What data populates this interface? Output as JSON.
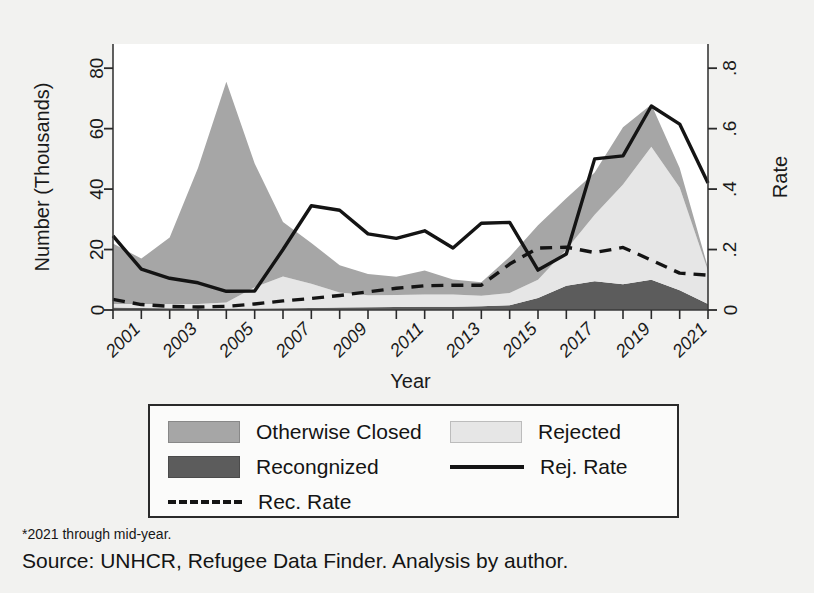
{
  "chart_data": {
    "type": "area",
    "title": "",
    "subtitle": "",
    "xlabel": "Year",
    "ylabel": "Number (Thousands)",
    "y2label": "Rate",
    "xlim": [
      2000,
      2021
    ],
    "ylim": [
      0,
      88
    ],
    "y2lim": [
      0,
      0.88
    ],
    "grid": false,
    "legend_position": "below-plot",
    "stacked": true,
    "x": [
      2000,
      2001,
      2002,
      2003,
      2004,
      2005,
      2006,
      2007,
      2008,
      2009,
      2010,
      2011,
      2012,
      2013,
      2014,
      2015,
      2016,
      2017,
      2018,
      2019,
      2020,
      2021
    ],
    "x_tick_labels": [
      "2001",
      "2003",
      "2005",
      "2007",
      "2009",
      "2011",
      "2013",
      "2015",
      "2017",
      "2019",
      "2021"
    ],
    "y_tick_labels": [
      "0",
      "20",
      "40",
      "60",
      "80"
    ],
    "y2_tick_labels": [
      "0",
      ".2",
      ".4",
      ".6",
      ".8"
    ],
    "series": [
      {
        "name": "Recongnized",
        "kind": "area",
        "stack_order": 1,
        "axis": "left",
        "color": "#5c5c5c",
        "values": [
          0.8,
          0.7,
          0.6,
          0.5,
          0.5,
          0.5,
          0.6,
          0.7,
          0.8,
          0.9,
          1.0,
          1.1,
          1.1,
          1.2,
          1.6,
          4.0,
          8.0,
          9.5,
          8.5,
          10.0,
          6.5,
          2.0
        ]
      },
      {
        "name": "Rejected",
        "kind": "area",
        "stack_order": 2,
        "axis": "left",
        "color": "#e6e6e6",
        "values": [
          1.2,
          1.3,
          1.4,
          1.5,
          2.0,
          7.0,
          10.5,
          8.0,
          5.0,
          4.0,
          4.0,
          4.0,
          4.0,
          3.5,
          4.0,
          6.0,
          12.0,
          22.0,
          33.0,
          44.0,
          34.0,
          11.0
        ]
      },
      {
        "name": "Otherwise Closed",
        "kind": "area",
        "stack_order": 3,
        "axis": "left",
        "color": "#a6a6a6",
        "values": [
          20.0,
          15.0,
          22.0,
          45.0,
          73.0,
          41.0,
          18.0,
          13.5,
          9.0,
          7.0,
          6.0,
          8.0,
          5.0,
          4.5,
          12.0,
          18.0,
          17.0,
          14.0,
          19.0,
          14.0,
          6.5,
          1.0
        ]
      },
      {
        "name": "Rej. Rate",
        "kind": "line",
        "style": "solid",
        "axis": "right",
        "color": "#141414",
        "values": [
          0.245,
          0.135,
          0.105,
          0.09,
          0.062,
          0.063,
          0.2,
          0.345,
          0.33,
          0.252,
          0.237,
          0.262,
          0.205,
          0.287,
          0.29,
          0.132,
          0.185,
          0.5,
          0.51,
          0.675,
          0.615,
          0.42
        ]
      },
      {
        "name": "Rec. Rate",
        "kind": "line",
        "style": "dashed",
        "axis": "right",
        "color": "#141414",
        "values": [
          0.035,
          0.018,
          0.012,
          0.01,
          0.012,
          0.02,
          0.03,
          0.038,
          0.048,
          0.06,
          0.072,
          0.08,
          0.082,
          0.082,
          0.152,
          0.205,
          0.208,
          0.19,
          0.207,
          0.165,
          0.122,
          0.115
        ]
      }
    ]
  },
  "axes": {
    "y_left_title": "Number (Thousands)",
    "y_right_title": "Rate",
    "x_title": "Year"
  },
  "legend": {
    "entries": [
      {
        "label": "Otherwise Closed",
        "marker": "swatch",
        "color": "#a6a6a6"
      },
      {
        "label": "Rejected",
        "marker": "swatch",
        "color": "#e6e6e6"
      },
      {
        "label": "Recongnized",
        "marker": "swatch",
        "color": "#5c5c5c"
      },
      {
        "label": "Rej. Rate",
        "marker": "solid-line",
        "color": "#141414"
      },
      {
        "label": "Rec. Rate",
        "marker": "dashed-line",
        "color": "#141414"
      }
    ]
  },
  "footnotes": {
    "note": "*2021 through mid-year.",
    "source": "Source: UNHCR, Refugee Data Finder. Analysis by author."
  }
}
